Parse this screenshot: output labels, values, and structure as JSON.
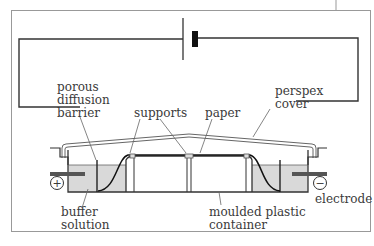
{
  "diagram": {
    "labels": {
      "porous_barrier": [
        "porous",
        "diffusion",
        "barrier"
      ],
      "supports": "supports",
      "paper": "paper",
      "perspex_cover": [
        "perspex",
        "cover"
      ],
      "buffer_solution": [
        "buffer",
        "solution"
      ],
      "moulded_container": [
        "moulded plastic",
        "container"
      ],
      "electrode": "electrode"
    },
    "terminals": {
      "positive": "+",
      "negative": "−"
    },
    "colors": {
      "frame": "#999999",
      "wire": "#333333",
      "buffer_fill": "#d9d9d9",
      "text": "#3a3a3a",
      "electrode_rod": "#555555"
    }
  }
}
